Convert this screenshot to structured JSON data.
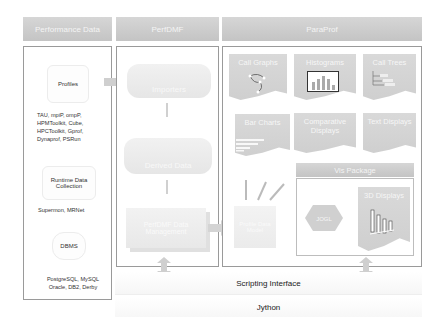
{
  "columns": {
    "performance_data": {
      "title": "Performance Data",
      "profiles_label": "Profiles",
      "profile_formats": [
        "TAU, mpiP, ompP,",
        "HPMToolkit, Cube,",
        "HPCToolkit, Gprof,",
        "Dynaprof, PSRun"
      ],
      "runtime_label_1": "Runtime Data",
      "runtime_label_2": "Collection",
      "runtime_tools": "Supermon, MRNet",
      "dbms_label": "DBMS",
      "dbms_list": [
        "PostgreSQL, MySQL",
        "Oracle, DB2, Derby"
      ]
    },
    "perfdmf": {
      "title": "PerfDMF",
      "importers_label": "Importers",
      "derived_label": "Derived Data",
      "datamgmt_label": "PerfDMF Data Management"
    },
    "paraprof": {
      "title": "ParaProf",
      "displays": [
        {
          "label": "Call Graphs"
        },
        {
          "label": "Histograms"
        },
        {
          "label": "Call Trees"
        },
        {
          "label": "Bar Charts"
        },
        {
          "label": "Comparative Displays"
        },
        {
          "label": "Text Displays"
        }
      ],
      "model_label": "Profile Data Model",
      "vis_package": {
        "title": "Vis Package",
        "jogl_label": "JOGL",
        "displays_3d_label": "3D Displays"
      }
    }
  },
  "bottom": {
    "scripting_label": "Scripting Interface",
    "jython_label": "Jython"
  },
  "colors": {
    "header_bg": "#c9c9c9",
    "header_text": "#f4f4f4",
    "panel_border": "#9a9a9a",
    "doc_bg": "#d4d4d4"
  }
}
